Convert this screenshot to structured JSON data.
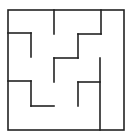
{
  "diagram": {
    "type": "maze",
    "background": "#ffffff",
    "stroke_color": "#222222",
    "stroke_width": 1.6,
    "outer_box": {
      "x1": 8,
      "y1": 10,
      "x2": 124,
      "y2": 130
    },
    "walls": [
      {
        "x1": 54,
        "y1": 10,
        "x2": 54,
        "y2": 34
      },
      {
        "x1": 101,
        "y1": 10,
        "x2": 101,
        "y2": 34
      },
      {
        "x1": 78,
        "y1": 34,
        "x2": 101,
        "y2": 34
      },
      {
        "x1": 78,
        "y1": 34,
        "x2": 78,
        "y2": 58
      },
      {
        "x1": 54,
        "y1": 58,
        "x2": 78,
        "y2": 58
      },
      {
        "x1": 54,
        "y1": 58,
        "x2": 54,
        "y2": 82
      },
      {
        "x1": 8,
        "y1": 33,
        "x2": 31,
        "y2": 33
      },
      {
        "x1": 31,
        "y1": 33,
        "x2": 31,
        "y2": 57
      },
      {
        "x1": 8,
        "y1": 81,
        "x2": 31,
        "y2": 81
      },
      {
        "x1": 31,
        "y1": 81,
        "x2": 31,
        "y2": 106
      },
      {
        "x1": 31,
        "y1": 106,
        "x2": 54,
        "y2": 106
      },
      {
        "x1": 100,
        "y1": 58,
        "x2": 100,
        "y2": 130
      },
      {
        "x1": 78,
        "y1": 82,
        "x2": 100,
        "y2": 82
      },
      {
        "x1": 78,
        "y1": 82,
        "x2": 78,
        "y2": 106
      }
    ]
  }
}
